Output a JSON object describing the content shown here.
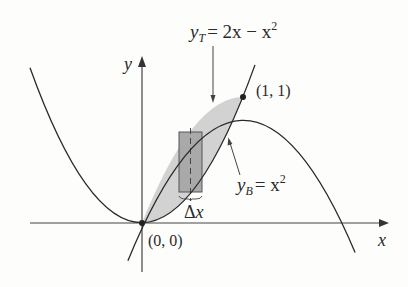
{
  "diagram": {
    "curves": [
      {
        "id": "top",
        "equation": "y = 2x - x^2",
        "label_var": "y",
        "label_sub": "T",
        "label_rhs": "= 2x − x",
        "label_sup": "2"
      },
      {
        "id": "bottom",
        "equation": "y = x^2",
        "label_var": "y",
        "label_sub": "B",
        "label_rhs": "= x",
        "label_sup": "2"
      }
    ],
    "points": [
      {
        "label": "(0, 0)",
        "x": 0,
        "y": 0
      },
      {
        "label": "(1, 1)",
        "x": 1,
        "y": 1
      }
    ],
    "axes": {
      "x_label": "x",
      "y_label": "y"
    },
    "strip": {
      "label_delta": "Δ",
      "label_var": "x"
    },
    "colors": {
      "region": "#d2d2d2",
      "strip": "#a9a9a9",
      "stroke": "#2a2a2a",
      "background": "#fdfdfc"
    }
  }
}
